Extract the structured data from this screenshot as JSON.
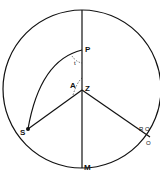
{
  "diagram": {
    "type": "celestial-sphere-projection",
    "labels": {
      "P": "P",
      "Z": "Z",
      "S": "S",
      "M": "M",
      "A": "A",
      "t": "t",
      "RO": "R O",
      "O": "O"
    },
    "colors": {
      "line": "#111111",
      "background": "#ffffff"
    }
  }
}
